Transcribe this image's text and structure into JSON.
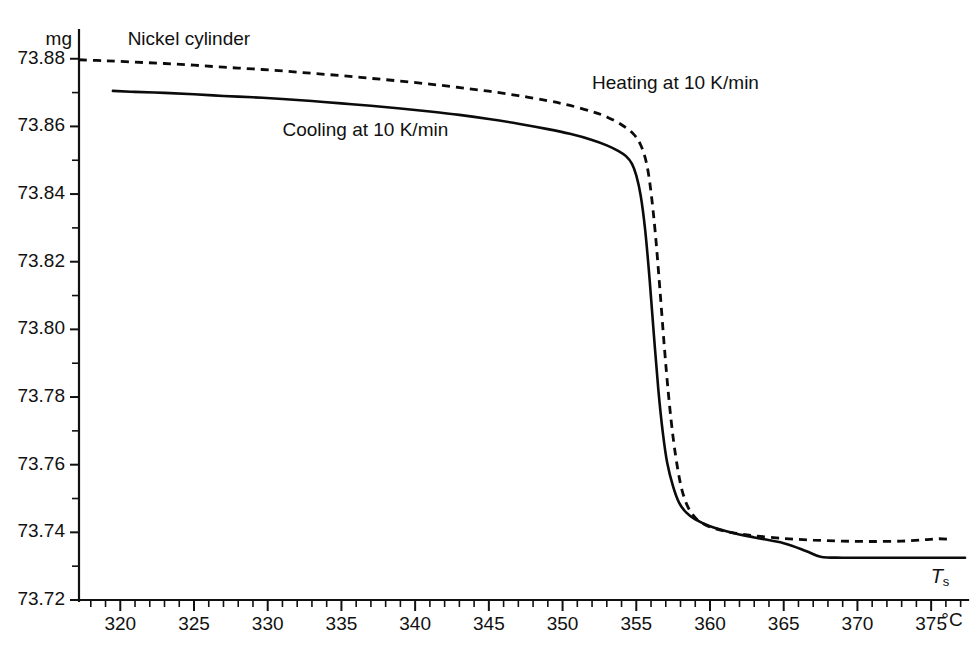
{
  "chart_data": {
    "type": "line",
    "title": "Nickel cylinder",
    "xlabel": "Ts",
    "xunit": "°C",
    "ylabel": "",
    "yunit": "mg",
    "grid": false,
    "legend_position": "inline-annotations",
    "xlim": [
      317.2,
      377.5
    ],
    "ylim": [
      73.72,
      73.8885
    ],
    "x_major_ticks": [
      320,
      325,
      330,
      335,
      340,
      345,
      350,
      355,
      360,
      365,
      370,
      375
    ],
    "x_tick_labels": [
      "320",
      "325",
      "330",
      "335",
      "340",
      "345",
      "350",
      "355",
      "360",
      "365",
      "370",
      "375"
    ],
    "x_minor_step": 1,
    "y_major_ticks": [
      73.72,
      73.74,
      73.76,
      73.78,
      73.8,
      73.82,
      73.84,
      73.86,
      73.88
    ],
    "y_tick_labels": [
      "73.72",
      "73.74",
      "73.76",
      "73.78",
      "73.80",
      "73.82",
      "73.84",
      "73.86",
      "73.88"
    ],
    "y_minor_step": 0.01,
    "annotations": [
      {
        "name": "sample-label",
        "text": "Nickel cylinder",
        "x": 320.5,
        "y": 73.8855
      },
      {
        "name": "heating-curve-label",
        "text": "Heating at 10 K/min",
        "x": 352.0,
        "y": 73.8725
      },
      {
        "name": "cooling-curve-label",
        "text": "Cooling at 10 K/min",
        "x": 331.0,
        "y": 73.8585
      }
    ],
    "series": [
      {
        "name": "Heating at 10 K/min",
        "style": "dashed",
        "color": "#0b0b0b",
        "points": [
          [
            317.2,
            73.8797
          ],
          [
            319.0,
            73.8794
          ],
          [
            321.0,
            73.879
          ],
          [
            323.0,
            73.8786
          ],
          [
            325.0,
            73.8781
          ],
          [
            327.0,
            73.8775
          ],
          [
            329.0,
            73.877
          ],
          [
            331.0,
            73.8764
          ],
          [
            333.0,
            73.8757
          ],
          [
            335.0,
            73.875
          ],
          [
            337.0,
            73.8742
          ],
          [
            339.0,
            73.8734
          ],
          [
            341.0,
            73.8725
          ],
          [
            343.0,
            73.8715
          ],
          [
            345.0,
            73.8704
          ],
          [
            347.0,
            73.8691
          ],
          [
            349.0,
            73.8676
          ],
          [
            350.5,
            73.8662
          ],
          [
            352.0,
            73.8644
          ],
          [
            353.0,
            73.8628
          ],
          [
            354.0,
            73.8605
          ],
          [
            354.8,
            73.8578
          ],
          [
            355.3,
            73.8545
          ],
          [
            355.7,
            73.849
          ],
          [
            356.0,
            73.8405
          ],
          [
            356.3,
            73.828
          ],
          [
            356.6,
            73.812
          ],
          [
            356.9,
            73.795
          ],
          [
            357.2,
            73.78
          ],
          [
            357.5,
            73.768
          ],
          [
            357.8,
            73.759
          ],
          [
            358.1,
            73.7525
          ],
          [
            358.5,
            73.7475
          ],
          [
            359.0,
            73.7443
          ],
          [
            359.6,
            73.7424
          ],
          [
            360.4,
            73.741
          ],
          [
            361.5,
            73.7399
          ],
          [
            363.0,
            73.739
          ],
          [
            365.0,
            73.7382
          ],
          [
            367.0,
            73.7377
          ],
          [
            369.0,
            73.7374
          ],
          [
            371.0,
            73.7373
          ],
          [
            373.0,
            73.7374
          ],
          [
            374.5,
            73.7378
          ],
          [
            375.5,
            73.7381
          ],
          [
            376.3,
            73.7379
          ]
        ]
      },
      {
        "name": "Cooling at 10 K/min",
        "style": "solid",
        "color": "#0b0b0b",
        "points": [
          [
            319.5,
            73.8705
          ],
          [
            321.0,
            73.8702
          ],
          [
            323.0,
            73.8699
          ],
          [
            325.0,
            73.8695
          ],
          [
            327.0,
            73.869
          ],
          [
            329.0,
            73.8686
          ],
          [
            331.0,
            73.8681
          ],
          [
            333.0,
            73.8675
          ],
          [
            335.0,
            73.8668
          ],
          [
            337.0,
            73.8661
          ],
          [
            339.0,
            73.8653
          ],
          [
            341.0,
            73.8644
          ],
          [
            343.0,
            73.8634
          ],
          [
            345.0,
            73.8622
          ],
          [
            347.0,
            73.8608
          ],
          [
            349.0,
            73.8592
          ],
          [
            350.5,
            73.8578
          ],
          [
            352.0,
            73.856
          ],
          [
            353.0,
            73.8544
          ],
          [
            353.8,
            73.8527
          ],
          [
            354.3,
            73.8512
          ],
          [
            354.7,
            73.849
          ],
          [
            355.0,
            73.8455
          ],
          [
            355.3,
            73.8395
          ],
          [
            355.6,
            73.8295
          ],
          [
            355.9,
            73.815
          ],
          [
            356.2,
            73.798
          ],
          [
            356.5,
            73.782
          ],
          [
            356.8,
            73.7695
          ],
          [
            357.1,
            73.7605
          ],
          [
            357.5,
            73.7535
          ],
          [
            357.9,
            73.7488
          ],
          [
            358.4,
            73.7458
          ],
          [
            359.0,
            73.7438
          ],
          [
            360.0,
            73.7418
          ],
          [
            361.5,
            73.7399
          ],
          [
            363.0,
            73.7385
          ],
          [
            365.0,
            73.7368
          ],
          [
            366.5,
            73.7345
          ],
          [
            367.5,
            73.7328
          ],
          [
            369.0,
            73.7325
          ],
          [
            372.0,
            73.7325
          ],
          [
            375.0,
            73.7325
          ],
          [
            377.3,
            73.7325
          ]
        ]
      }
    ]
  },
  "axis_label_variable": "T",
  "axis_label_subscript": "s"
}
